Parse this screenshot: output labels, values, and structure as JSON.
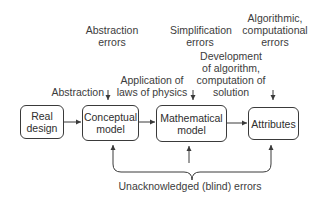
{
  "diagram": {
    "boxes": {
      "real_design": "Real\ndesign",
      "conceptual_model": "Conceptual\nmodel",
      "mathematical_model": "Mathematical\nmodel",
      "attributes": "Attributes"
    },
    "process_labels": {
      "abstraction": "Abstraction",
      "application": "Application of\nlaws of physics",
      "development": "Development\nof algorithm,\ncomputation of\nsolution"
    },
    "error_labels": {
      "abstraction_errors": "Abstraction\nerrors",
      "simplification_errors": "Simplification\nerrors",
      "algorithmic_errors": "Algorithmic,\ncomputational\nerrors"
    },
    "bottom_label": "Unacknowledged (blind) errors",
    "colors": {
      "line": "#3a3a3a",
      "text": "#3c3c3c",
      "background": "#ffffff"
    }
  }
}
